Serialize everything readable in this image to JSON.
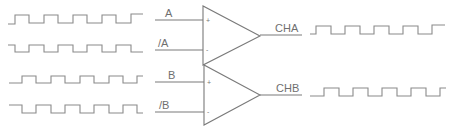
{
  "diagram": {
    "channels": [
      {
        "name": "A",
        "inputs": [
          {
            "label": "A",
            "polarity": "+",
            "pin_label": "+"
          },
          {
            "label": "/A",
            "polarity": "-",
            "pin_label": "-"
          }
        ],
        "output_label": "CHA"
      },
      {
        "name": "B",
        "inputs": [
          {
            "label": "B",
            "polarity": "+",
            "pin_label": "+"
          },
          {
            "label": "/B",
            "polarity": "-",
            "pin_label": "-"
          }
        ],
        "output_label": "CHB"
      }
    ],
    "waveforms": {
      "A": "square",
      "/A": "square-inverted",
      "B": "square",
      "/B": "square-inverted",
      "CHA": "square",
      "CHB": "square"
    },
    "colors": {
      "line": "#7a7a7a",
      "text": "#6f6f6f",
      "background": "#ffffff"
    }
  }
}
